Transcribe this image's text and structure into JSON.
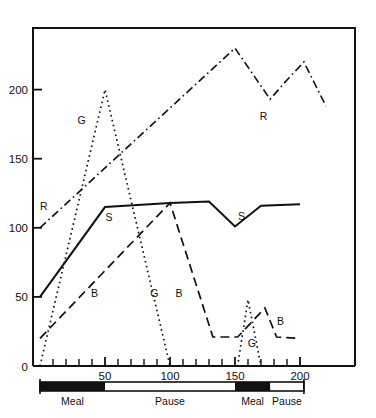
{
  "chart_data": {
    "type": "line",
    "title": "",
    "xlabel": "",
    "ylabel": "",
    "xlim": [
      0,
      205
    ],
    "ylim": [
      0,
      245
    ],
    "grid": false,
    "legend": "inline-labels",
    "x_ticks_major": [
      50,
      100,
      150,
      200
    ],
    "x_tick_labels": [
      "50",
      "100",
      "150",
      "200"
    ],
    "x_ticks_minor": [
      10,
      20,
      30,
      40,
      60,
      70,
      80,
      90,
      110,
      120,
      130,
      140,
      160,
      170,
      180,
      190
    ],
    "y_ticks_major": [
      0,
      50,
      100,
      150,
      200
    ],
    "y_tick_labels": [
      "0",
      "50",
      "100",
      "150",
      "200"
    ],
    "series": [
      {
        "name": "R",
        "label": "R",
        "style": "dash-dot",
        "stroke_width": 1.6,
        "label_positions": [
          {
            "x": 3,
            "y": 113
          },
          {
            "x": 172,
            "y": 178
          }
        ],
        "points": [
          {
            "x": 0,
            "y": 100
          },
          {
            "x": 150,
            "y": 230
          },
          {
            "x": 177,
            "y": 193
          },
          {
            "x": 190,
            "y": 207
          },
          {
            "x": 203,
            "y": 220
          },
          {
            "x": 220,
            "y": 188
          }
        ]
      },
      {
        "name": "S",
        "label": "S",
        "style": "solid",
        "stroke_width": 2.0,
        "label_positions": [
          {
            "x": 53,
            "y": 105
          },
          {
            "x": 155,
            "y": 106
          }
        ],
        "points": [
          {
            "x": 0,
            "y": 50
          },
          {
            "x": 50,
            "y": 115
          },
          {
            "x": 100,
            "y": 118
          },
          {
            "x": 130,
            "y": 119
          },
          {
            "x": 150,
            "y": 101
          },
          {
            "x": 170,
            "y": 116
          },
          {
            "x": 200,
            "y": 117
          }
        ]
      },
      {
        "name": "B",
        "label": "B",
        "style": "dashed",
        "stroke_width": 1.7,
        "label_positions": [
          {
            "x": 42,
            "y": 50
          },
          {
            "x": 107,
            "y": 50
          },
          {
            "x": 185,
            "y": 30
          }
        ],
        "points": [
          {
            "x": 0,
            "y": 20
          },
          {
            "x": 100,
            "y": 118
          },
          {
            "x": 133,
            "y": 21
          },
          {
            "x": 152,
            "y": 21
          },
          {
            "x": 173,
            "y": 42
          },
          {
            "x": 182,
            "y": 21
          },
          {
            "x": 200,
            "y": 20
          }
        ]
      },
      {
        "name": "G",
        "label": "G",
        "style": "dotted",
        "stroke_width": 1.7,
        "label_positions": [
          {
            "x": 32,
            "y": 175
          },
          {
            "x": 88,
            "y": 50
          },
          {
            "x": 163,
            "y": 14
          }
        ],
        "points": [
          {
            "x": 0,
            "y": 0
          },
          {
            "x": 50,
            "y": 200
          },
          {
            "x": 100,
            "y": 0
          },
          {
            "x": 152,
            "y": 0
          },
          {
            "x": 160,
            "y": 48
          },
          {
            "x": 170,
            "y": 0
          }
        ]
      }
    ]
  },
  "phase_bar": {
    "segments": [
      {
        "label": "Meal",
        "from": 0,
        "to": 50,
        "filled": true
      },
      {
        "label": "Pause",
        "from": 50,
        "to": 150,
        "filled": false
      },
      {
        "label": "Meal",
        "from": 150,
        "to": 177,
        "filled": true
      },
      {
        "label": "Pause",
        "from": 177,
        "to": 203,
        "filled": false
      }
    ]
  }
}
